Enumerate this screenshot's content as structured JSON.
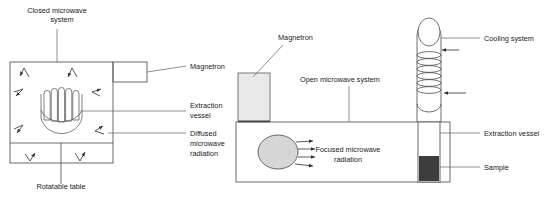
{
  "figure": {
    "background_color": "#ffffff",
    "line_color": "#4a4a4a",
    "text_color": "#1a1a1a"
  },
  "closed_system": {
    "title": "Closed microwave\nsystem",
    "title_line1": "Closed microwave",
    "title_line2": "system",
    "magnetron_label": "Magnetron",
    "extraction_vessel_label_line1": "Extraction",
    "extraction_vessel_label_line2": "vessel",
    "diffused_label_line1": "Diffused",
    "diffused_label_line2": "microwave",
    "diffused_label_line3": "radiation",
    "rotatable_table_label": "Rotatable  table",
    "chamber_fill": "#ffffff",
    "magnetron_fill": "#ffffff",
    "arrow_count": 8
  },
  "open_system": {
    "magnetron_label": "Magnetron",
    "system_label": "Open microwave system",
    "cooling_label": "Cooling system",
    "extraction_vessel_label": "Extraction vessel",
    "sample_label": "Sample",
    "focused_label_line1": "Focused microwave",
    "focused_label_line2": "radiation",
    "magnetron_fill": "#e8e8e8",
    "source_fill": "#d4d4d4",
    "sample_fill": "#3d3d3d",
    "chamber_fill": "#ffffff",
    "ray_count": 4,
    "coil_turns": 6,
    "coolant_arrow_count": 2
  }
}
